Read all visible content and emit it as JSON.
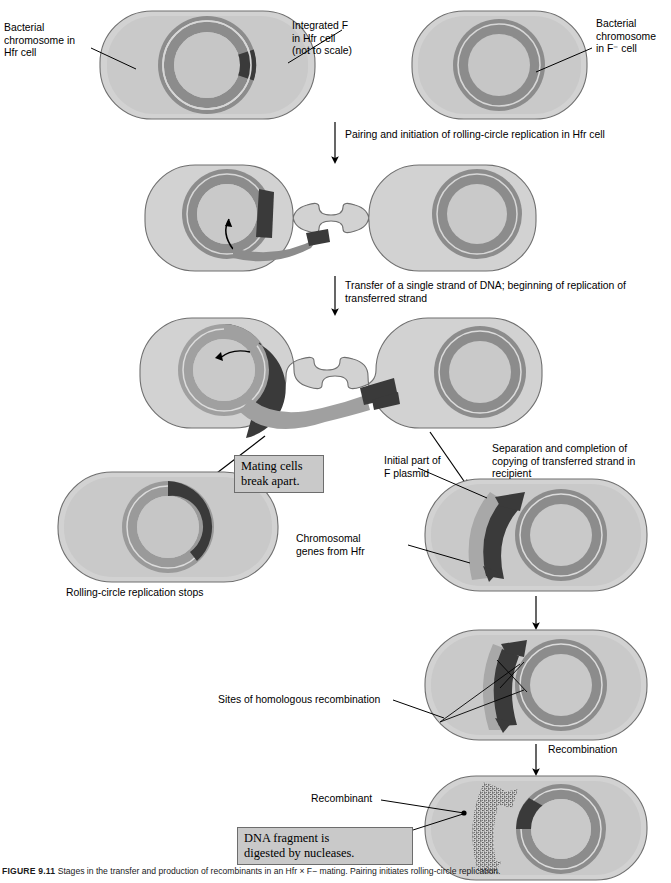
{
  "figure": {
    "number": "FIGURE 9.11",
    "caption": "Stages in the transfer and production of recombinants in an Hfr × F− mating. Pairing initiates rolling-circle replication."
  },
  "palette": {
    "cell_fill": "#d2d2d2",
    "cell_inner_fill": "#c6c6c6",
    "cell_outline": "#6f6f6f",
    "chromosome_gray": "#8c8c8c",
    "chromosome_light": "#a8a8a8",
    "f_factor_dark": "#3a3a3a",
    "strand_dark": "#333333",
    "callout_bg": "#c9c9c9",
    "callout_border": "#6d6d6d",
    "line": "#000000"
  },
  "labels": {
    "bacterial_chromosome_hfr": "Bacterial\nchromosome in\nHfr cell",
    "integrated_f": "Integrated F\nin Hfr cell\n(not to scale)",
    "bacterial_chromosome_f_minus": "Bacterial\nchromosome\nin F⁻ cell",
    "step_pairing": "Pairing and initiation of rolling-circle replication in Hfr cell",
    "step_transfer": "Transfer of a single strand of DNA; beginning of replication of\ntransferred strand",
    "step_separation": "Separation and completion of\ncopying of transferred strand in\nrecipient",
    "rolling_circle_stops": "Rolling-circle replication stops",
    "initial_part_f_plasmid": "Initial part of\nF plasmid",
    "chromosomal_genes_from_hfr": "Chromosomal\ngenes from Hfr",
    "sites_of_homologous_recombination": "Sites of homologous recombination",
    "step_recombination": "Recombination",
    "recombinant": "Recombinant"
  },
  "callouts": {
    "mating_cells_break_apart": "Mating cells\nbreak apart.",
    "dna_fragment_digested": "DNA fragment is\ndigested by nucleases."
  }
}
